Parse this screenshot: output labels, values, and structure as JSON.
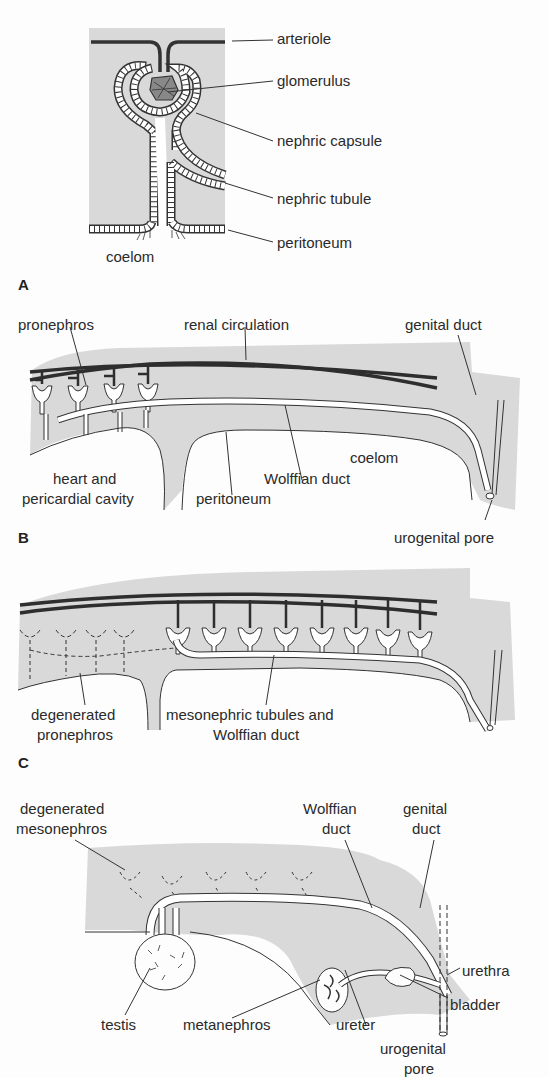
{
  "colors": {
    "tissue_fill": "#d9d9d9",
    "line": "#333333",
    "vessel": "#2e2e2e",
    "background": "#fdfdfd"
  },
  "panels": {
    "A": {
      "letter": "A",
      "labels": {
        "arteriole": "arteriole",
        "glomerulus": "glomerulus",
        "nephric_capsule": "nephric capsule",
        "nephric_tubule": "nephric tubule",
        "peritoneum": "peritoneum",
        "coelom": "coelom"
      }
    },
    "B": {
      "letter": "B",
      "labels": {
        "pronephros": "pronephros",
        "renal_circulation": "renal circulation",
        "genital_duct": "genital duct",
        "coelom": "coelom",
        "heart_line1": "heart and",
        "heart_line2": "pericardial cavity",
        "peritoneum": "peritoneum",
        "wolffian_duct": "Wolffian duct",
        "urogenital_pore": "urogenital pore"
      }
    },
    "C": {
      "letter": "C",
      "labels": {
        "degenerated_line1": "degenerated",
        "degenerated_line2": "pronephros",
        "mesonephric_line1": "mesonephric tubules and",
        "mesonephric_line2": "Wolffian duct"
      }
    },
    "D": {
      "labels": {
        "degenerated_line1": "degenerated",
        "degenerated_line2": "mesonephros",
        "wolffian_line1": "Wolffian",
        "wolffian_line2": "duct",
        "genital_line1": "genital",
        "genital_line2": "duct",
        "urethra": "urethra",
        "bladder": "bladder",
        "testis": "testis",
        "metanephros": "metanephros",
        "ureter": "ureter",
        "urogenital_line1": "urogenital",
        "urogenital_line2": "pore"
      }
    }
  }
}
